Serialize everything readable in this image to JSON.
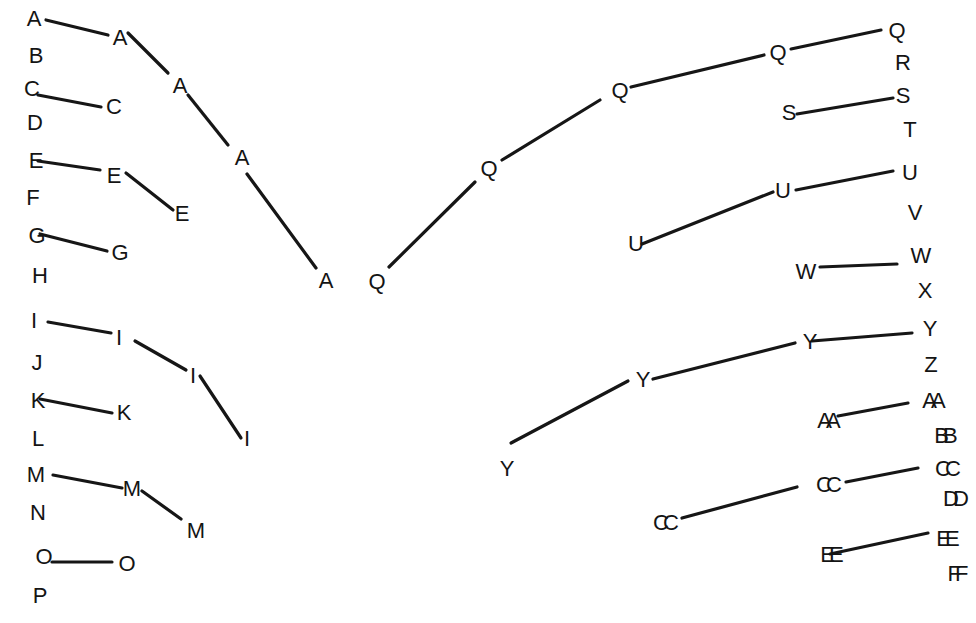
{
  "diagram": {
    "type": "labeled-node-chains",
    "background": "#ffffff",
    "stroke_color": "#161616",
    "label_color": "#141414"
  },
  "nodes": [
    {
      "id": "A1",
      "label": "A",
      "x": 34,
      "y": 18
    },
    {
      "id": "A2",
      "label": "A",
      "x": 120,
      "y": 37
    },
    {
      "id": "A3",
      "label": "A",
      "x": 180,
      "y": 85
    },
    {
      "id": "A4",
      "label": "A",
      "x": 242,
      "y": 157
    },
    {
      "id": "A5",
      "label": "A",
      "x": 326,
      "y": 280
    },
    {
      "id": "B1",
      "label": "B",
      "x": 36,
      "y": 55
    },
    {
      "id": "C1",
      "label": "C",
      "x": 32,
      "y": 88
    },
    {
      "id": "C2",
      "label": "C",
      "x": 114,
      "y": 106
    },
    {
      "id": "D1",
      "label": "D",
      "x": 35,
      "y": 122
    },
    {
      "id": "E1",
      "label": "E",
      "x": 36,
      "y": 160
    },
    {
      "id": "E2",
      "label": "E",
      "x": 114,
      "y": 175
    },
    {
      "id": "E3",
      "label": "E",
      "x": 182,
      "y": 213
    },
    {
      "id": "F1",
      "label": "F",
      "x": 33,
      "y": 197
    },
    {
      "id": "G1",
      "label": "G",
      "x": 37,
      "y": 235
    },
    {
      "id": "G2",
      "label": "G",
      "x": 120,
      "y": 252
    },
    {
      "id": "H1",
      "label": "H",
      "x": 40,
      "y": 275
    },
    {
      "id": "I1",
      "label": "I",
      "x": 34,
      "y": 320
    },
    {
      "id": "I2",
      "label": "I",
      "x": 119,
      "y": 337
    },
    {
      "id": "I3",
      "label": "I",
      "x": 193,
      "y": 375
    },
    {
      "id": "I4",
      "label": "I",
      "x": 247,
      "y": 438
    },
    {
      "id": "J1",
      "label": "J",
      "x": 37,
      "y": 362
    },
    {
      "id": "K1",
      "label": "K",
      "x": 38,
      "y": 400
    },
    {
      "id": "K2",
      "label": "K",
      "x": 124,
      "y": 412
    },
    {
      "id": "L1",
      "label": "L",
      "x": 38,
      "y": 438
    },
    {
      "id": "M1",
      "label": "M",
      "x": 36,
      "y": 474
    },
    {
      "id": "M2",
      "label": "M",
      "x": 132,
      "y": 488
    },
    {
      "id": "M3",
      "label": "M",
      "x": 196,
      "y": 530
    },
    {
      "id": "N1",
      "label": "N",
      "x": 38,
      "y": 512
    },
    {
      "id": "O1",
      "label": "O",
      "x": 44,
      "y": 556
    },
    {
      "id": "O2",
      "label": "O",
      "x": 127,
      "y": 563
    },
    {
      "id": "P1",
      "label": "P",
      "x": 40,
      "y": 595
    },
    {
      "id": "Q1",
      "label": "Q",
      "x": 377,
      "y": 281
    },
    {
      "id": "Q2",
      "label": "Q",
      "x": 489,
      "y": 168
    },
    {
      "id": "Q3",
      "label": "Q",
      "x": 620,
      "y": 90
    },
    {
      "id": "Q4",
      "label": "Q",
      "x": 778,
      "y": 52
    },
    {
      "id": "Q5",
      "label": "Q",
      "x": 897,
      "y": 30
    },
    {
      "id": "R1",
      "label": "R",
      "x": 903,
      "y": 62
    },
    {
      "id": "S1",
      "label": "S",
      "x": 789,
      "y": 112
    },
    {
      "id": "S2",
      "label": "S",
      "x": 903,
      "y": 95
    },
    {
      "id": "T1",
      "label": "T",
      "x": 910,
      "y": 129
    },
    {
      "id": "U1",
      "label": "U",
      "x": 636,
      "y": 243
    },
    {
      "id": "U2",
      "label": "U",
      "x": 783,
      "y": 190
    },
    {
      "id": "U3",
      "label": "U",
      "x": 910,
      "y": 172
    },
    {
      "id": "V1",
      "label": "V",
      "x": 915,
      "y": 212
    },
    {
      "id": "W1",
      "label": "W",
      "x": 806,
      "y": 271
    },
    {
      "id": "W2",
      "label": "W",
      "x": 921,
      "y": 255
    },
    {
      "id": "X1",
      "label": "X",
      "x": 925,
      "y": 290
    },
    {
      "id": "Y1",
      "label": "Y",
      "x": 507,
      "y": 468
    },
    {
      "id": "Y2",
      "label": "Y",
      "x": 643,
      "y": 379
    },
    {
      "id": "Y3",
      "label": "Y",
      "x": 810,
      "y": 341
    },
    {
      "id": "Y4",
      "label": "Y",
      "x": 930,
      "y": 328
    },
    {
      "id": "Z1",
      "label": "Z",
      "x": 931,
      "y": 364
    },
    {
      "id": "AA1",
      "label": "AA",
      "x": 823,
      "y": 420
    },
    {
      "id": "AA2",
      "label": "AA",
      "x": 928,
      "y": 400
    },
    {
      "id": "BB1",
      "label": "BB",
      "x": 940,
      "y": 435
    },
    {
      "id": "CC1",
      "label": "CC",
      "x": 660,
      "y": 522
    },
    {
      "id": "CC2",
      "label": "CC",
      "x": 823,
      "y": 484
    },
    {
      "id": "CC3",
      "label": "CC",
      "x": 942,
      "y": 468
    },
    {
      "id": "DD1",
      "label": "DD",
      "x": 950,
      "y": 498
    },
    {
      "id": "EE1",
      "label": "EE",
      "x": 826,
      "y": 554
    },
    {
      "id": "EE2",
      "label": "EE",
      "x": 942,
      "y": 538
    },
    {
      "id": "FF1",
      "label": "FF",
      "x": 952,
      "y": 573
    }
  ],
  "edges": [
    {
      "from": "A1",
      "to": "A2",
      "x1": 46,
      "y1": 20,
      "x2": 108,
      "y2": 35
    },
    {
      "from": "A2",
      "to": "A3",
      "x1": 128,
      "y1": 33,
      "x2": 168,
      "y2": 73
    },
    {
      "from": "A3",
      "to": "A4",
      "x1": 188,
      "y1": 95,
      "x2": 228,
      "y2": 145
    },
    {
      "from": "A4",
      "to": "A5",
      "x1": 247,
      "y1": 174,
      "x2": 316,
      "y2": 268
    },
    {
      "from": "C1",
      "to": "C2",
      "x1": 38,
      "y1": 95,
      "x2": 101,
      "y2": 107
    },
    {
      "from": "E1",
      "to": "E2",
      "x1": 38,
      "y1": 161,
      "x2": 100,
      "y2": 170
    },
    {
      "from": "E2",
      "to": "E3",
      "x1": 126,
      "y1": 173,
      "x2": 173,
      "y2": 210
    },
    {
      "from": "G1",
      "to": "G2",
      "x1": 40,
      "y1": 234,
      "x2": 107,
      "y2": 251
    },
    {
      "from": "I1",
      "to": "I2",
      "x1": 48,
      "y1": 322,
      "x2": 111,
      "y2": 333
    },
    {
      "from": "I2",
      "to": "I3",
      "x1": 135,
      "y1": 341,
      "x2": 186,
      "y2": 370
    },
    {
      "from": "I3",
      "to": "I4",
      "x1": 200,
      "y1": 376,
      "x2": 241,
      "y2": 438
    },
    {
      "from": "K1",
      "to": "K2",
      "x1": 40,
      "y1": 399,
      "x2": 112,
      "y2": 413
    },
    {
      "from": "M1",
      "to": "M2",
      "x1": 53,
      "y1": 475,
      "x2": 122,
      "y2": 488
    },
    {
      "from": "M2",
      "to": "M3",
      "x1": 142,
      "y1": 491,
      "x2": 181,
      "y2": 519
    },
    {
      "from": "O1",
      "to": "O2",
      "x1": 52,
      "y1": 562,
      "x2": 112,
      "y2": 562
    },
    {
      "from": "Q1",
      "to": "Q2",
      "x1": 389,
      "y1": 267,
      "x2": 475,
      "y2": 182
    },
    {
      "from": "Q2",
      "to": "Q3",
      "x1": 502,
      "y1": 160,
      "x2": 600,
      "y2": 100
    },
    {
      "from": "Q3",
      "to": "Q4",
      "x1": 631,
      "y1": 87,
      "x2": 764,
      "y2": 55
    },
    {
      "from": "Q4",
      "to": "Q5",
      "x1": 791,
      "y1": 49,
      "x2": 881,
      "y2": 30
    },
    {
      "from": "S1",
      "to": "S2",
      "x1": 797,
      "y1": 114,
      "x2": 893,
      "y2": 98
    },
    {
      "from": "U1",
      "to": "U2",
      "x1": 642,
      "y1": 244,
      "x2": 773,
      "y2": 192
    },
    {
      "from": "U2",
      "to": "U3",
      "x1": 796,
      "y1": 190,
      "x2": 893,
      "y2": 171
    },
    {
      "from": "W1",
      "to": "W2",
      "x1": 820,
      "y1": 267,
      "x2": 897,
      "y2": 264
    },
    {
      "from": "Y1",
      "to": "Y2",
      "x1": 511,
      "y1": 443,
      "x2": 628,
      "y2": 381
    },
    {
      "from": "Y2",
      "to": "Y3",
      "x1": 653,
      "y1": 379,
      "x2": 795,
      "y2": 343
    },
    {
      "from": "Y3",
      "to": "Y4",
      "x1": 812,
      "y1": 341,
      "x2": 912,
      "y2": 333
    },
    {
      "from": "AA1",
      "to": "AA2",
      "x1": 838,
      "y1": 416,
      "x2": 908,
      "y2": 403
    },
    {
      "from": "CC1",
      "to": "CC2",
      "x1": 682,
      "y1": 518,
      "x2": 797,
      "y2": 487
    },
    {
      "from": "CC2",
      "to": "CC3",
      "x1": 846,
      "y1": 482,
      "x2": 918,
      "y2": 468
    },
    {
      "from": "EE1",
      "to": "EE2",
      "x1": 830,
      "y1": 554,
      "x2": 928,
      "y2": 533
    }
  ]
}
